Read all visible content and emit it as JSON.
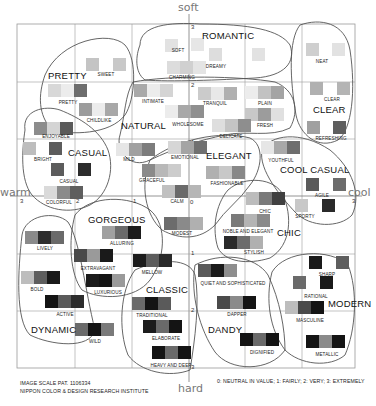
{
  "axes": {
    "top": "soft",
    "bottom": "hard",
    "left": "warm",
    "right": "cool",
    "ticks": {
      "x": [
        {
          "label": "3",
          "x": 20,
          "y": 198
        },
        {
          "label": "2",
          "x": 76,
          "y": 198
        },
        {
          "label": "1",
          "x": 133,
          "y": 198
        },
        {
          "label": "0",
          "x": 189,
          "y": 199
        },
        {
          "label": "1",
          "x": 244,
          "y": 198
        },
        {
          "label": "2",
          "x": 300,
          "y": 198
        },
        {
          "label": "3",
          "x": 355,
          "y": 198
        }
      ],
      "y": [
        {
          "label": "3",
          "x": 189,
          "y": 23
        },
        {
          "label": "2",
          "x": 189,
          "y": 80
        },
        {
          "label": "1",
          "x": 189,
          "y": 137
        },
        {
          "label": "1",
          "x": 189,
          "y": 253
        },
        {
          "label": "2",
          "x": 189,
          "y": 311
        },
        {
          "label": "3",
          "x": 189,
          "y": 368
        }
      ]
    }
  },
  "groups": [
    {
      "label": "ROMANTIC",
      "x": 202,
      "y": 30
    },
    {
      "label": "PRETTY",
      "x": 48,
      "y": 70
    },
    {
      "label": "CLEAR",
      "x": 313,
      "y": 104
    },
    {
      "label": "NATURAL",
      "x": 121,
      "y": 120
    },
    {
      "label": "CASUAL",
      "x": 68,
      "y": 147
    },
    {
      "label": "ELEGANT",
      "x": 206,
      "y": 150
    },
    {
      "label": "COOL  CASUAL",
      "x": 280,
      "y": 164
    },
    {
      "label": "CHIC",
      "x": 277,
      "y": 227
    },
    {
      "label": "GORGEOUS",
      "x": 88,
      "y": 214
    },
    {
      "label": "CLASSIC",
      "x": 146,
      "y": 284
    },
    {
      "label": "MODERN",
      "x": 328,
      "y": 298
    },
    {
      "label": "DYNAMIC",
      "x": 31,
      "y": 324
    },
    {
      "label": "DANDY",
      "x": 208,
      "y": 324
    }
  ],
  "words": [
    {
      "label": "SOFT",
      "x": 178,
      "y": 48,
      "swatches": [],
      "sx": 0,
      "sy": 0
    },
    {
      "label": "SWEET",
      "x": 106,
      "y": 72,
      "swatches": [],
      "sx": 0,
      "sy": 0
    },
    {
      "label": "CHARMING",
      "x": 182,
      "y": 75,
      "swatches": [],
      "sx": 0,
      "sy": 0
    },
    {
      "label": "DREAMY",
      "x": 216,
      "y": 64,
      "swatches": [],
      "sx": 0,
      "sy": 0
    },
    {
      "label": "NEAT",
      "x": 322,
      "y": 59,
      "swatches": [],
      "sx": 0,
      "sy": 0
    },
    {
      "label": "PRETTY",
      "x": 68,
      "y": 100,
      "swatches": [],
      "sx": 0,
      "sy": 0
    },
    {
      "label": "INTIMATE",
      "x": 153,
      "y": 99,
      "swatches": [],
      "sx": 0,
      "sy": 0
    },
    {
      "label": "TRANQUIL",
      "x": 215,
      "y": 101,
      "swatches": [],
      "sx": 0,
      "sy": 0
    },
    {
      "label": "PLAIN",
      "x": 265,
      "y": 101,
      "swatches": [],
      "sx": 0,
      "sy": 0
    },
    {
      "label": "CLEAR",
      "x": 332,
      "y": 97,
      "swatches": [],
      "sx": 0,
      "sy": 0
    },
    {
      "label": "CHILDLIKE",
      "x": 99,
      "y": 118,
      "swatches": [],
      "sx": 0,
      "sy": 0
    },
    {
      "label": "WHOLESOME",
      "x": 188,
      "y": 122,
      "swatches": [],
      "sx": 0,
      "sy": 0
    },
    {
      "label": "FRESH",
      "x": 265,
      "y": 123,
      "swatches": [],
      "sx": 0,
      "sy": 0
    },
    {
      "label": "ENJOYABLE",
      "x": 56,
      "y": 134,
      "swatches": [],
      "sx": 0,
      "sy": 0
    },
    {
      "label": "DELICATE",
      "x": 231,
      "y": 134,
      "swatches": [],
      "sx": 0,
      "sy": 0
    },
    {
      "label": "REFRESHING",
      "x": 331,
      "y": 136,
      "swatches": [],
      "sx": 0,
      "sy": 0
    },
    {
      "label": "BRIGHT",
      "x": 43,
      "y": 157,
      "swatches": [],
      "sx": 0,
      "sy": 0
    },
    {
      "label": "MILD",
      "x": 129,
      "y": 157,
      "swatches": [],
      "sx": 0,
      "sy": 0
    },
    {
      "label": "EMOTIONAL",
      "x": 185,
      "y": 155,
      "swatches": [],
      "sx": 0,
      "sy": 0
    },
    {
      "label": "YOUTHFUL",
      "x": 281,
      "y": 158,
      "swatches": [],
      "sx": 0,
      "sy": 0
    },
    {
      "label": "CASUAL",
      "x": 69,
      "y": 179,
      "swatches": [],
      "sx": 0,
      "sy": 0
    },
    {
      "label": "GRACEFUL",
      "x": 152,
      "y": 178,
      "swatches": [],
      "sx": 0,
      "sy": 0
    },
    {
      "label": "FASHIONABLE",
      "x": 227,
      "y": 181,
      "swatches": [],
      "sx": 0,
      "sy": 0
    },
    {
      "label": "AGILE",
      "x": 322,
      "y": 193,
      "swatches": [],
      "sx": 0,
      "sy": 0
    },
    {
      "label": "COLORFUL",
      "x": 59,
      "y": 200,
      "swatches": [],
      "sx": 0,
      "sy": 0
    },
    {
      "label": "CALM",
      "x": 177,
      "y": 199,
      "swatches": [],
      "sx": 0,
      "sy": 0
    },
    {
      "label": "CHIC",
      "x": 265,
      "y": 209,
      "swatches": [],
      "sx": 0,
      "sy": 0
    },
    {
      "label": "SPORTY",
      "x": 305,
      "y": 214,
      "swatches": [],
      "sx": 0,
      "sy": 0
    },
    {
      "label": "MODEST",
      "x": 182,
      "y": 231,
      "swatches": [],
      "sx": 0,
      "sy": 0
    },
    {
      "label": "NOBLE AND ELEGANT",
      "x": 248,
      "y": 229,
      "swatches": [],
      "sx": 0,
      "sy": 0
    },
    {
      "label": "ALLURING",
      "x": 122,
      "y": 241,
      "swatches": [],
      "sx": 0,
      "sy": 0
    },
    {
      "label": "LIVELY",
      "x": 45,
      "y": 246,
      "swatches": [],
      "sx": 0,
      "sy": 0
    },
    {
      "label": "STYLISH",
      "x": 254,
      "y": 250,
      "swatches": [],
      "sx": 0,
      "sy": 0
    },
    {
      "label": "EXTRAVAGANT",
      "x": 98,
      "y": 266,
      "swatches": [],
      "sx": 0,
      "sy": 0
    },
    {
      "label": "MELLOW",
      "x": 152,
      "y": 270,
      "swatches": [],
      "sx": 0,
      "sy": 0
    },
    {
      "label": "QUIET AND SOPHISTICATED",
      "x": 233,
      "y": 281,
      "swatches": [],
      "sx": 0,
      "sy": 0
    },
    {
      "label": "SHARP",
      "x": 327,
      "y": 272,
      "swatches": [],
      "sx": 0,
      "sy": 0
    },
    {
      "label": "BOLD",
      "x": 37,
      "y": 287,
      "swatches": [],
      "sx": 0,
      "sy": 0
    },
    {
      "label": "LUXURIOUS",
      "x": 108,
      "y": 290,
      "swatches": [],
      "sx": 0,
      "sy": 0
    },
    {
      "label": "RATIONAL",
      "x": 316,
      "y": 294,
      "swatches": [],
      "sx": 0,
      "sy": 0
    },
    {
      "label": "ACTIVE",
      "x": 65,
      "y": 312,
      "swatches": [],
      "sx": 0,
      "sy": 0
    },
    {
      "label": "TRADITIONAL",
      "x": 152,
      "y": 313,
      "swatches": [],
      "sx": 0,
      "sy": 0
    },
    {
      "label": "DAPPER",
      "x": 237,
      "y": 312,
      "swatches": [],
      "sx": 0,
      "sy": 0
    },
    {
      "label": "MASCULINE",
      "x": 310,
      "y": 318,
      "swatches": [],
      "sx": 0,
      "sy": 0
    },
    {
      "label": "ELABORATE",
      "x": 166,
      "y": 336,
      "swatches": [],
      "sx": 0,
      "sy": 0
    },
    {
      "label": "WILD",
      "x": 95,
      "y": 339,
      "swatches": [],
      "sx": 0,
      "sy": 0
    },
    {
      "label": "DIGNIFIED",
      "x": 262,
      "y": 350,
      "swatches": [],
      "sx": 0,
      "sy": 0
    },
    {
      "label": "METALLIC",
      "x": 327,
      "y": 352,
      "swatches": [],
      "sx": 0,
      "sy": 0
    },
    {
      "label": "HEAVY AND DEEP",
      "x": 171,
      "y": 363,
      "swatches": [],
      "sx": 0,
      "sy": 0
    }
  ],
  "swatch_groups": [
    {
      "x": 165,
      "y": 39,
      "colors": [
        "#e2e2e2"
      ],
      "gap": 0
    },
    {
      "x": 191,
      "y": 38,
      "colors": [
        "#e6e6e6"
      ],
      "gap": 0
    },
    {
      "x": 86,
      "y": 58,
      "colors": [
        "#c4c4c4",
        "#c8c8c8"
      ],
      "gap": 14
    },
    {
      "x": 167,
      "y": 61,
      "colors": [
        "#dcdcdc",
        "#d0d0d0",
        "#e4e4e4"
      ],
      "gap": 0
    },
    {
      "x": 209,
      "y": 48,
      "colors": [
        "#dddddd"
      ],
      "gap": 0
    },
    {
      "x": 252,
      "y": 48,
      "colors": [
        "#e2e2e2"
      ],
      "gap": 0
    },
    {
      "x": 306,
      "y": 43,
      "colors": [
        "#cfcfcf"
      ],
      "gap": 0
    },
    {
      "x": 332,
      "y": 43,
      "colors": [
        "#e2e2e2"
      ],
      "gap": 0
    },
    {
      "x": 48,
      "y": 84,
      "colors": [
        "#d8d8d8",
        "#ececec",
        "#6d6d6d"
      ],
      "gap": 0
    },
    {
      "x": 134,
      "y": 84,
      "colors": [
        "#a9a9a9",
        "#ececec",
        "#d4d4d4"
      ],
      "gap": 0
    },
    {
      "x": 198,
      "y": 87,
      "colors": [
        "#cbcbcb",
        "#e8e8e8",
        "#b0b0b0"
      ],
      "gap": 0
    },
    {
      "x": 245,
      "y": 86,
      "colors": [
        "#ececec",
        "#c2c2c2",
        "#a4a4a4"
      ],
      "gap": 0
    },
    {
      "x": 310,
      "y": 82,
      "colors": [
        "#b0b0b0"
      ],
      "gap": 0
    },
    {
      "x": 337,
      "y": 82,
      "colors": [
        "#b4b4b4"
      ],
      "gap": 0
    },
    {
      "x": 79,
      "y": 103,
      "colors": [
        "#9c9c9c",
        "#ececec",
        "#a8a8a8"
      ],
      "gap": 0
    },
    {
      "x": 165,
      "y": 105,
      "colors": [
        "#ececec",
        "#a8a8a8",
        "#8f8f8f"
      ],
      "gap": 0
    },
    {
      "x": 245,
      "y": 108,
      "colors": [
        "#c8c8c8",
        "#9c9c9c",
        "#e0e0e0"
      ],
      "gap": 0
    },
    {
      "x": 34,
      "y": 122,
      "colors": [
        "#8c8c8c",
        "#d4d4d4",
        "#5a5a5a"
      ],
      "gap": 0
    },
    {
      "x": 212,
      "y": 119,
      "colors": [
        "#dedede",
        "#c4c4c4",
        "#8e8e8e"
      ],
      "gap": 0
    },
    {
      "x": 307,
      "y": 121,
      "colors": [
        "#a0a0a0"
      ],
      "gap": 0
    },
    {
      "x": 333,
      "y": 121,
      "colors": [
        "#5e5e5e"
      ],
      "gap": 0
    },
    {
      "x": 23,
      "y": 142,
      "colors": [
        "#bdbdbd"
      ],
      "gap": 0
    },
    {
      "x": 49,
      "y": 142,
      "colors": [
        "#5c5c5c"
      ],
      "gap": 0
    },
    {
      "x": 116,
      "y": 143,
      "colors": [
        "#e6e6e6",
        "#a0a0a0",
        "#7c7c7c"
      ],
      "gap": 0
    },
    {
      "x": 168,
      "y": 141,
      "colors": [
        "#d6d6d6",
        "#a4a4a4",
        "#707070"
      ],
      "gap": 0
    },
    {
      "x": 261,
      "y": 141,
      "colors": [
        "#e6e6e6",
        "#a8a8a8",
        "#6e6e6e"
      ],
      "gap": 0
    },
    {
      "x": 51,
      "y": 163,
      "colors": [
        "#5c5c5c"
      ],
      "gap": 0
    },
    {
      "x": 78,
      "y": 163,
      "colors": [
        "#2c2c2c"
      ],
      "gap": 0
    },
    {
      "x": 142,
      "y": 164,
      "colors": [
        "#8a8a8a",
        "#b8b8b8",
        "#cccccc"
      ],
      "gap": 0
    },
    {
      "x": 206,
      "y": 166,
      "colors": [
        "#b0b0b0",
        "#c8c8c8",
        "#888888"
      ],
      "gap": 0
    },
    {
      "x": 306,
      "y": 178,
      "colors": [
        "#5a5a5a"
      ],
      "gap": 0
    },
    {
      "x": 333,
      "y": 178,
      "colors": [
        "#6c6c6c"
      ],
      "gap": 0
    },
    {
      "x": 44,
      "y": 186,
      "colors": [
        "#dadada",
        "#8a8a8a",
        "#5e5e5e"
      ],
      "gap": 0
    },
    {
      "x": 162,
      "y": 185,
      "colors": [
        "#c0c0c0",
        "#6a6a6a",
        "#b6b6b6"
      ],
      "gap": 0
    },
    {
      "x": 246,
      "y": 192,
      "colors": [
        "#bcbcbc",
        "#7a7a7a",
        "#404040"
      ],
      "gap": 0
    },
    {
      "x": 295,
      "y": 199,
      "colors": [
        "#c8c8c8"
      ],
      "gap": 0
    },
    {
      "x": 322,
      "y": 199,
      "colors": [
        "#2a2a2a"
      ],
      "gap": 0
    },
    {
      "x": 164,
      "y": 217,
      "colors": [
        "#6c6c6c",
        "#8a8a8a",
        "#b0b0b0"
      ],
      "gap": 0
    },
    {
      "x": 231,
      "y": 214,
      "colors": [
        "#7a7a7a",
        "#b4b4b4",
        "#8a8a8a"
      ],
      "gap": 0
    },
    {
      "x": 102,
      "y": 226,
      "colors": [
        "#a0a0a0",
        "#6a6a6a",
        "#1c1c1c"
      ],
      "gap": 0
    },
    {
      "x": 25,
      "y": 231,
      "colors": [
        "#8a8a8a",
        "#2e2e2e",
        "#6a6a6a"
      ],
      "gap": 0
    },
    {
      "x": 224,
      "y": 236,
      "colors": [
        "#2a2a2a",
        "#6c6c6c",
        "#b0b0b0"
      ],
      "gap": 0
    },
    {
      "x": 74,
      "y": 249,
      "colors": [
        "#4a4a4a",
        "#9a9a9a",
        "#1a1a1a"
      ],
      "gap": 0
    },
    {
      "x": 133,
      "y": 254,
      "colors": [
        "#1c1c1c",
        "#5c5c5c",
        "#2a2a2a"
      ],
      "gap": 0
    },
    {
      "x": 309,
      "y": 256,
      "colors": [
        "#1a1a1a"
      ],
      "gap": 0
    },
    {
      "x": 336,
      "y": 256,
      "colors": [
        "#5e5e5e"
      ],
      "gap": 0
    },
    {
      "x": 198,
      "y": 264,
      "colors": [
        "#5a5a5a",
        "#1a1a1a",
        "#8e8e8e"
      ],
      "gap": 0
    },
    {
      "x": 21,
      "y": 271,
      "colors": [
        "#bdbdbd",
        "#5e5e5e",
        "#1a1a1a"
      ],
      "gap": 0
    },
    {
      "x": 86,
      "y": 274,
      "colors": [
        "#1c1c1c",
        "#141414",
        "#9a9a9a"
      ],
      "gap": 0
    },
    {
      "x": 293,
      "y": 276,
      "colors": [
        "#6a6a6a"
      ],
      "gap": 0
    },
    {
      "x": 320,
      "y": 276,
      "colors": [
        "#1a1a1a"
      ],
      "gap": 0
    },
    {
      "x": 45,
      "y": 295,
      "colors": [
        "#141414",
        "#5a5a5a",
        "#2c2c2c"
      ],
      "gap": 0
    },
    {
      "x": 132,
      "y": 297,
      "colors": [
        "#6a6a6a",
        "#141414",
        "#5a5a5a"
      ],
      "gap": 0
    },
    {
      "x": 217,
      "y": 296,
      "colors": [
        "#4a4a4a",
        "#8a8a8a",
        "#141414"
      ],
      "gap": 0
    },
    {
      "x": 285,
      "y": 301,
      "colors": [
        "#bdbdbd",
        "#4a4a4a",
        "#141414"
      ],
      "gap": 0
    },
    {
      "x": 143,
      "y": 320,
      "colors": [
        "#1c1c1c",
        "#6a6a6a",
        "#141414"
      ],
      "gap": 0
    },
    {
      "x": 75,
      "y": 323,
      "colors": [
        "#6a6a6a",
        "#141414",
        "#7a7a7a"
      ],
      "gap": 0
    },
    {
      "x": 240,
      "y": 333,
      "colors": [
        "#141414",
        "#6a6a6a",
        "#141414"
      ],
      "gap": 0
    },
    {
      "x": 306,
      "y": 335,
      "colors": [
        "#141414",
        "#8a8a8a",
        "#141414"
      ],
      "gap": 0
    },
    {
      "x": 152,
      "y": 346,
      "colors": [
        "#141414",
        "#6a6a6a",
        "#141414"
      ],
      "gap": 0
    }
  ],
  "footer": {
    "left_line1": "IMAGE SCALE PAT. 1106334",
    "left_line2": "NIPPON COLOR & DESIGN RESEARCH INSTITUTE",
    "right_legend": "0: NEUTRAL IN VALUE; 1: FAIRLY; 2: VERY; 3: EXTREMELY"
  },
  "colors": {
    "grid_line": "#9a9a9a",
    "curve_line": "#555555",
    "axis_text": "#777777"
  }
}
